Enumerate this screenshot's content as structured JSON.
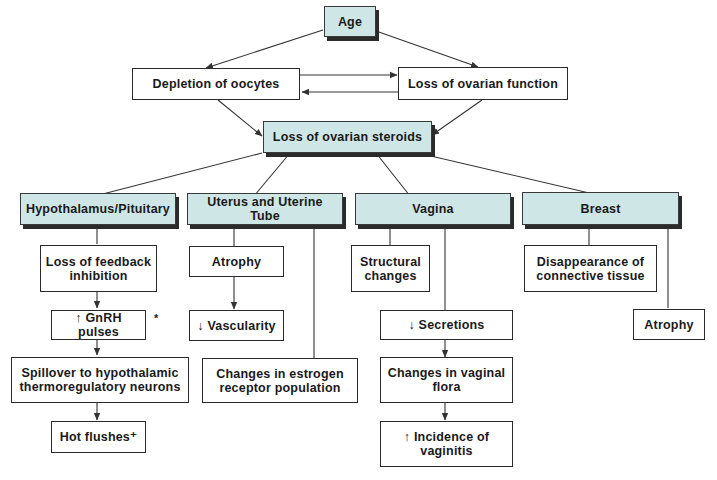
{
  "diagram": {
    "colors": {
      "shaded_fill": "#cfe6e6",
      "border": "#2a2a2a",
      "shadow": "#2b2b2b",
      "line": "#333333"
    },
    "nodes": {
      "age": {
        "label": "Age",
        "shaded": true
      },
      "depletion": {
        "label": "Depletion of oocytes"
      },
      "loss_function": {
        "label": "Loss of ovarian function"
      },
      "loss_steroids": {
        "label": "Loss of ovarian steroids",
        "shaded": true
      },
      "hypothalamus": {
        "label": "Hypothalamus/Pituitary",
        "shaded": true
      },
      "uterus": {
        "label": "Uterus and Uterine Tube",
        "shaded": true
      },
      "vagina": {
        "label": "Vagina",
        "shaded": true
      },
      "breast": {
        "label": "Breast",
        "shaded": true
      },
      "feedback": {
        "label": "Loss of feedback\ninhibition"
      },
      "gnrh": {
        "label": "↑ GnRH pulses"
      },
      "spillover": {
        "label": "Spillover to hypothalamic\nthermoregulatory neurons"
      },
      "hot_flushes": {
        "label": "Hot flushes⁺"
      },
      "ut_atrophy": {
        "label": "Atrophy"
      },
      "vascularity": {
        "label": "↓ Vascularity"
      },
      "estrogen_receptor": {
        "label": "Changes in estrogen\nreceptor population"
      },
      "structural": {
        "label": "Structural\nchanges"
      },
      "secretions": {
        "label": "↓ Secretions"
      },
      "flora": {
        "label": "Changes in vaginal\nflora"
      },
      "vaginitis": {
        "label": "↑ Incidence of\nvaginitis"
      },
      "connective": {
        "label": "Disappearance of\nconnective tissue"
      },
      "br_atrophy": {
        "label": "Atrophy"
      }
    },
    "notes": {
      "gnrh_asterisk": "*"
    },
    "edges": [
      [
        "age",
        "depletion"
      ],
      [
        "age",
        "loss_function"
      ],
      [
        "depletion",
        "loss_function"
      ],
      [
        "loss_function",
        "depletion"
      ],
      [
        "depletion",
        "loss_steroids"
      ],
      [
        "loss_function",
        "loss_steroids"
      ],
      [
        "loss_steroids",
        "hypothalamus"
      ],
      [
        "loss_steroids",
        "uterus"
      ],
      [
        "loss_steroids",
        "vagina"
      ],
      [
        "loss_steroids",
        "breast"
      ],
      [
        "hypothalamus",
        "feedback"
      ],
      [
        "feedback",
        "gnrh"
      ],
      [
        "gnrh",
        "spillover"
      ],
      [
        "spillover",
        "hot_flushes"
      ],
      [
        "uterus",
        "ut_atrophy"
      ],
      [
        "ut_atrophy",
        "vascularity"
      ],
      [
        "uterus",
        "estrogen_receptor"
      ],
      [
        "vagina",
        "structural"
      ],
      [
        "vagina",
        "secretions"
      ],
      [
        "secretions",
        "flora"
      ],
      [
        "flora",
        "vaginitis"
      ],
      [
        "breast",
        "connective"
      ],
      [
        "breast",
        "br_atrophy"
      ]
    ]
  }
}
